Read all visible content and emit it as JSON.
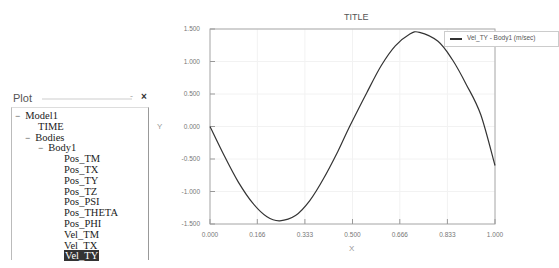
{
  "panel": {
    "title": "Plot",
    "minimize_label": "-",
    "close_label": "×",
    "tree": [
      {
        "label": "Model1",
        "level": 0,
        "toggle": "−",
        "selected": false
      },
      {
        "label": "TIME",
        "level": 1,
        "toggle": "",
        "selected": false
      },
      {
        "label": "Bodies",
        "level": 1,
        "toggle": "−",
        "selected": false
      },
      {
        "label": "Body1",
        "level": 2,
        "toggle": "−",
        "selected": false
      },
      {
        "label": "Pos_TM",
        "level": 3,
        "toggle": "",
        "selected": false
      },
      {
        "label": "Pos_TX",
        "level": 3,
        "toggle": "",
        "selected": false
      },
      {
        "label": "Pos_TY",
        "level": 3,
        "toggle": "",
        "selected": false
      },
      {
        "label": "Pos_TZ",
        "level": 3,
        "toggle": "",
        "selected": false
      },
      {
        "label": "Pos_PSI",
        "level": 3,
        "toggle": "",
        "selected": false
      },
      {
        "label": "Pos_THETA",
        "level": 3,
        "toggle": "",
        "selected": false
      },
      {
        "label": "Pos_PHI",
        "level": 3,
        "toggle": "",
        "selected": false
      },
      {
        "label": "Vel_TM",
        "level": 3,
        "toggle": "",
        "selected": false
      },
      {
        "label": "Vel_TX",
        "level": 3,
        "toggle": "",
        "selected": false
      },
      {
        "label": "Vel_TY",
        "level": 3,
        "toggle": "",
        "selected": true
      }
    ]
  },
  "chart_data": {
    "type": "line",
    "title": "TITLE",
    "xlabel": "X",
    "ylabel": "Y",
    "xlim": [
      0.0,
      1.0
    ],
    "ylim": [
      -1.5,
      1.5
    ],
    "x_ticks": [
      "0.000",
      "0.166",
      "0.333",
      "0.500",
      "0.666",
      "0.833",
      "1.000"
    ],
    "y_ticks": [
      "1.500",
      "1.000",
      "0.500",
      "0.000",
      "-0.500",
      "-1.000",
      "-1.500"
    ],
    "grid": true,
    "legend_position": "upper right (outside)",
    "series": [
      {
        "name": "Vel_TY - Body1 (m/sec)",
        "color": "#333333",
        "x": [
          0.0,
          0.05,
          0.1,
          0.15,
          0.2,
          0.245,
          0.3,
          0.35,
          0.4,
          0.45,
          0.49,
          0.55,
          0.6,
          0.65,
          0.7,
          0.735,
          0.8,
          0.85,
          0.9,
          0.95,
          1.0
        ],
        "y": [
          0.0,
          -0.45,
          -0.86,
          -1.18,
          -1.39,
          -1.45,
          -1.37,
          -1.14,
          -0.79,
          -0.37,
          0.0,
          0.52,
          0.93,
          1.24,
          1.42,
          1.45,
          1.31,
          1.03,
          0.64,
          0.18,
          -0.6
        ]
      }
    ]
  }
}
